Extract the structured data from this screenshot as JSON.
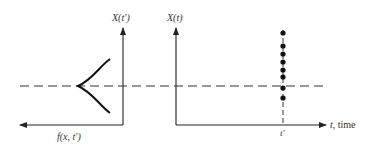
{
  "diagram": {
    "left_panel": {
      "y_axis_label": "X(t′)",
      "x_axis_label": "f(x, t′)",
      "curve": "bell-shaped distribution density rotated sideways, peaked leftward at the mean level"
    },
    "right_panel": {
      "y_axis_label": "X(t)",
      "x_axis_label_var": "t",
      "x_axis_label_text": ", time",
      "tick_label": "t′",
      "sample_points_count": 8
    },
    "reference_line": "dashed horizontal line at mean level across both panels",
    "colors": {
      "ink": "#222222",
      "background": "#ffffff"
    }
  }
}
